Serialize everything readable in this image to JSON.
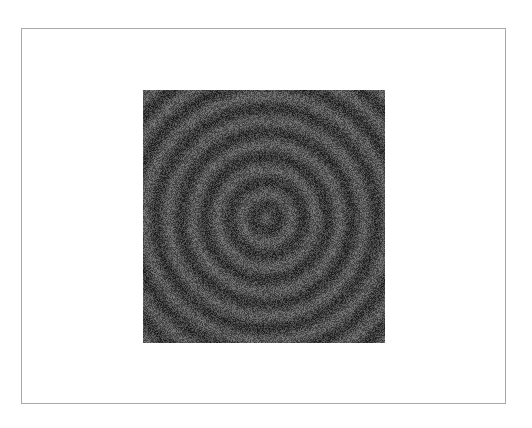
{
  "canvas": {
    "background": "#ffffff",
    "frame_border_color": "#a8a8a8"
  },
  "image": {
    "description": "Noisy concentric ring pattern",
    "pattern": "concentric-rings-with-noise",
    "base_gray": "#4a4a4a",
    "ring_center": [
      123,
      128
    ],
    "ring_period_px": 24.5,
    "ring_contrast": 18,
    "noise_amplitude": 34
  }
}
